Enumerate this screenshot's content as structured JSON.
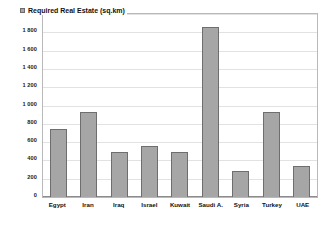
{
  "chart_data": {
    "type": "bar",
    "title": "",
    "subtitle": "",
    "xlabel": "",
    "ylabel": "",
    "ylim": [
      0,
      2000
    ],
    "grid": true,
    "legend_position": "top-left",
    "categories": [
      "Egypt",
      "Iran",
      "Iraq",
      "Israel",
      "Kuwait",
      "Saudi A.",
      "Syria",
      "Turkey",
      "UAE"
    ],
    "series": [
      {
        "name": "Required Real Estate (sq.km)",
        "values": [
          745,
          935,
          490,
          565,
          490,
          1870,
          285,
          935,
          340
        ]
      }
    ],
    "y_ticks": [
      "0",
      "200",
      "400",
      "600",
      "800",
      "1 000",
      "1 200",
      "1 400",
      "1 600",
      "1 800",
      "2 000"
    ],
    "y_tick_values": [
      0,
      200,
      400,
      600,
      800,
      1000,
      1200,
      1400,
      1600,
      1800,
      2000
    ]
  },
  "legend": {
    "label": "Required Real Estate (sq.km)",
    "swatch_color": "#a6a6a6"
  },
  "colors": {
    "bar_fill": "#a6a6a6",
    "bar_border": "#6e6e6e",
    "gridline": "#e2e2e2",
    "plot_border": "#b9b9b9",
    "text": "#111111",
    "background": "#ffffff"
  }
}
